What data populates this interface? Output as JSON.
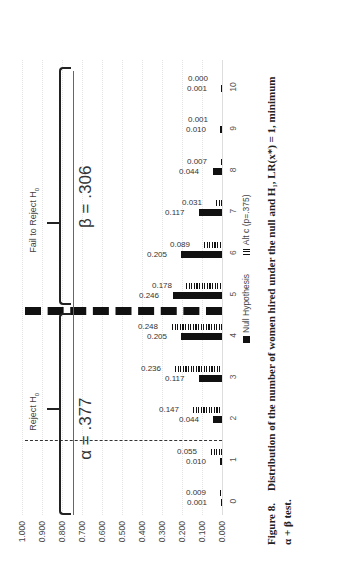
{
  "chart_data": {
    "type": "bar",
    "title": "",
    "xlabel": "",
    "ylabel": "",
    "ylim": [
      0,
      1
    ],
    "y_ticks": [
      "1.000",
      "0.900",
      "0.800",
      "0.700",
      "0.600",
      "0.500",
      "0.400",
      "0.300",
      "0.200",
      "0.100",
      "0.000"
    ],
    "categories": [
      "0",
      "1",
      "2",
      "3",
      "4",
      "5",
      "6",
      "7",
      "8",
      "9",
      "10"
    ],
    "series": [
      {
        "name": "Null Hypothesis",
        "style": "solid",
        "values": [
          0.001,
          0.01,
          0.044,
          0.117,
          0.205,
          0.246,
          0.205,
          0.117,
          0.044,
          0.01,
          0.001
        ]
      },
      {
        "name": "Alt c (p=.375)",
        "style": "hatched",
        "values": [
          0.009,
          0.055,
          0.147,
          0.236,
          0.248,
          0.178,
          0.089,
          0.031,
          0.007,
          0.001,
          0.0
        ]
      }
    ],
    "value_labels": {
      "null": [
        "0.001",
        "0.010",
        "0.044",
        "0.117",
        "0.205",
        "0.246",
        "0.205",
        "0.117",
        "0.044",
        "0.010",
        "0.001"
      ],
      "alt": [
        "0.009",
        "0.055",
        "0.147",
        "0.236",
        "0.248",
        "0.178",
        "0.089",
        "0.031",
        "0.007",
        "0.001",
        "0.000"
      ]
    },
    "annotations": {
      "reject_label": "Reject H",
      "reject_sub": "0",
      "fail_label": "Fail to Reject H",
      "fail_sub": "0",
      "alpha_text": "α = .377",
      "beta_text": "β = .306",
      "alpha_cut_between": [
        "1",
        "2"
      ],
      "decision_cut_between": [
        "4",
        "5"
      ]
    },
    "legend_position": "bottom",
    "grid": true,
    "orientation": "rotated 90° counter-clockwise on page"
  },
  "legend": {
    "null_label": "Null Hypothesis",
    "alt_label": "Alt c (p=.375)"
  },
  "caption": {
    "figure_label": "Figure 8.",
    "line1": "Distribution of the number of women hired under the null and H₁, LR(x*) = 1, minimum",
    "line2": "α + β test."
  }
}
